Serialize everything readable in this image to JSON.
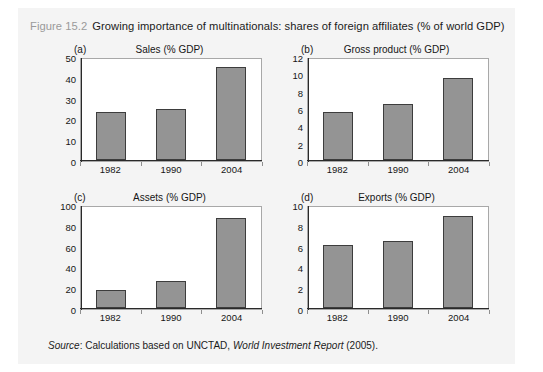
{
  "figure": {
    "number": "Figure 15.2",
    "caption": "Growing importance of multinationals: shares of foreign affiliates (% of world GDP)",
    "source_prefix": "Source",
    "source_text": ": Calculations based on UNCTAD, ",
    "source_italic_title": "World Investment Report",
    "source_suffix": " (2005)."
  },
  "colors": {
    "bar_fill": "#949494",
    "bar_border": "#3d3d3d",
    "panel_background": "#f4f4f4",
    "plot_background": "#ffffff",
    "axis": "#2a2a2a",
    "frame": "#a8a8a8",
    "caption_number": "#9a9a9a",
    "text": "#161616"
  },
  "chart_data": [
    {
      "type": "bar",
      "panel": "(a)",
      "title": "Sales (% GDP)",
      "categories": [
        "1982",
        "1990",
        "2004"
      ],
      "values": [
        23.5,
        25,
        45.5
      ],
      "xlabel": "",
      "ylabel": "",
      "ylim": [
        0,
        50
      ],
      "yticks": [
        0,
        10,
        20,
        30,
        40,
        50
      ],
      "ytick_labels": [
        "0",
        "10",
        "20",
        "30",
        "40",
        "50"
      ],
      "grid": false,
      "legend": "none"
    },
    {
      "type": "bar",
      "panel": "(b)",
      "title": "Gross product (% GDP)",
      "categories": [
        "1982",
        "1990",
        "2004"
      ],
      "values": [
        5.6,
        6.6,
        9.6
      ],
      "xlabel": "",
      "ylabel": "",
      "ylim": [
        0,
        12
      ],
      "yticks": [
        0,
        2,
        4,
        6,
        8,
        10,
        12
      ],
      "ytick_labels": [
        "0",
        "2",
        "4",
        "6",
        "8",
        "10",
        "12"
      ],
      "grid": false,
      "legend": "none"
    },
    {
      "type": "bar",
      "panel": "(c)",
      "title": "Assets (% GDP)",
      "categories": [
        "1982",
        "1990",
        "2004"
      ],
      "values": [
        18,
        26,
        88
      ],
      "xlabel": "",
      "ylabel": "",
      "ylim": [
        0,
        100
      ],
      "yticks": [
        0,
        20,
        40,
        60,
        80,
        100
      ],
      "ytick_labels": [
        "0",
        "20",
        "40",
        "60",
        "80",
        "100"
      ],
      "grid": false,
      "legend": "none"
    },
    {
      "type": "bar",
      "panel": "(d)",
      "title": "Exports (% GDP)",
      "categories": [
        "1982",
        "1990",
        "2004"
      ],
      "values": [
        6.2,
        6.6,
        9.0
      ],
      "xlabel": "",
      "ylabel": "",
      "ylim": [
        0,
        10
      ],
      "yticks": [
        0,
        2,
        4,
        6,
        8,
        10
      ],
      "ytick_labels": [
        "0",
        "2",
        "4",
        "6",
        "8",
        "10"
      ],
      "grid": false,
      "legend": "none"
    }
  ]
}
